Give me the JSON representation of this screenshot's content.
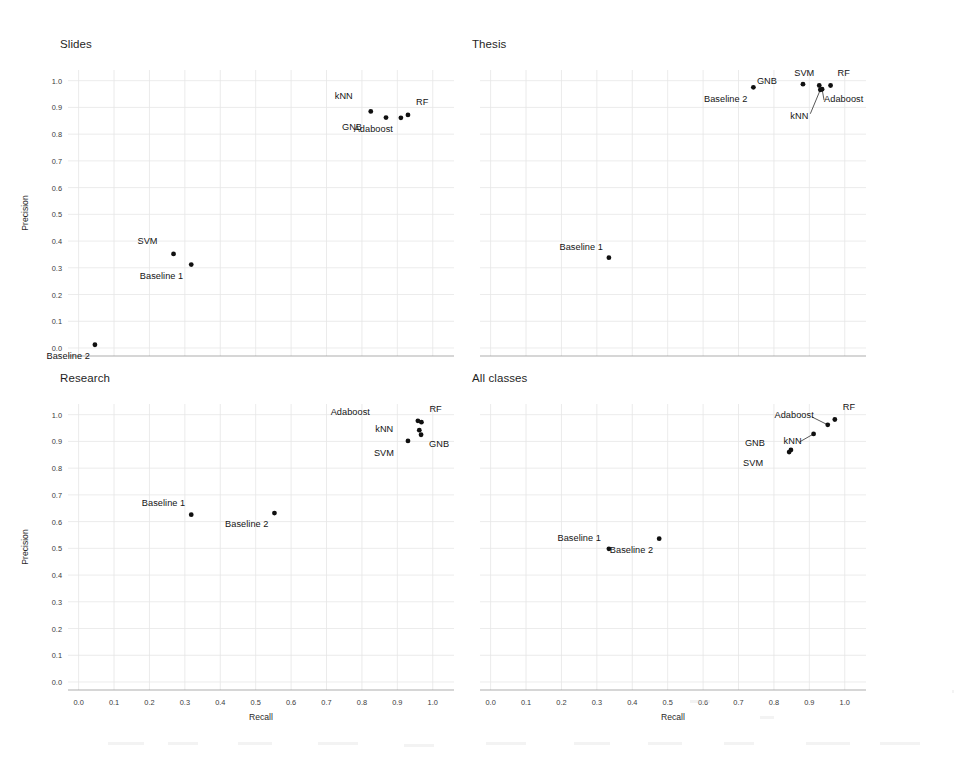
{
  "figure": {
    "width": 954,
    "height": 771,
    "background": "#ffffff",
    "point_color": "#101010",
    "grid_color": "#e6e6e6",
    "axis_color": "#8a8a8a"
  },
  "chart_data": {
    "type": "scatter",
    "title": "",
    "xlabel": "Recall",
    "ylabel": "Precision",
    "xlim": [
      -0.03,
      1.06
    ],
    "ylim": [
      -0.03,
      1.04
    ],
    "grid": true,
    "legend": "none",
    "xticks": [
      "0.0",
      "0.1",
      "0.2",
      "0.3",
      "0.4",
      "0.5",
      "0.6",
      "0.7",
      "0.8",
      "0.9",
      "1.0"
    ],
    "xtick_values": [
      0.0,
      0.1,
      0.2,
      0.3,
      0.4,
      0.5,
      0.6,
      0.7,
      0.8,
      0.9,
      1.0
    ],
    "yticks": [
      "0.0",
      "0.1",
      "0.2",
      "0.3",
      "0.4",
      "0.5",
      "0.6",
      "0.7",
      "0.8",
      "0.9",
      "1.0"
    ],
    "ytick_values": [
      0.0,
      0.1,
      0.2,
      0.3,
      0.4,
      0.5,
      0.6,
      0.7,
      0.8,
      0.9,
      1.0
    ],
    "panels": [
      {
        "id": "slides",
        "title": "Slides",
        "show_ylabel": true,
        "show_yticks": true,
        "show_xticks": false,
        "show_xlabel": false,
        "points": [
          {
            "name": "kNN",
            "x": 0.825,
            "y": 0.885,
            "label_dx": -18,
            "label_dy": -14,
            "leader": false
          },
          {
            "name": "GNB",
            "x": 0.868,
            "y": 0.862,
            "label_dx": -24,
            "label_dy": 10,
            "leader": false
          },
          {
            "name": "Adaboost",
            "x": 0.91,
            "y": 0.861,
            "label_dx": -8,
            "label_dy": 12,
            "leader": false
          },
          {
            "name": "RF",
            "x": 0.93,
            "y": 0.872,
            "label_dx": 8,
            "label_dy": -12,
            "leader": false
          },
          {
            "name": "SVM",
            "x": 0.268,
            "y": 0.352,
            "label_dx": -16,
            "label_dy": -12,
            "leader": false
          },
          {
            "name": "Baseline 1",
            "x": 0.318,
            "y": 0.312,
            "label_dx": -8,
            "label_dy": 12,
            "leader": false
          },
          {
            "name": "Baseline 2",
            "x": 0.046,
            "y": 0.012,
            "label_dx": -5,
            "label_dy": 12,
            "leader": false
          }
        ]
      },
      {
        "id": "thesis",
        "title": "Thesis",
        "show_ylabel": false,
        "show_yticks": false,
        "show_xticks": false,
        "show_xlabel": false,
        "points": [
          {
            "name": "Baseline 2",
            "x": 0.742,
            "y": 0.975,
            "label_dx": -6,
            "label_dy": 13,
            "leader": false
          },
          {
            "name": "GNB",
            "x": 0.882,
            "y": 0.987,
            "label_dx": -26,
            "label_dy": -2,
            "leader": false
          },
          {
            "name": "SVM",
            "x": 0.928,
            "y": 0.982,
            "label_dx": -5,
            "label_dy": -12,
            "leader": false
          },
          {
            "name": "RF",
            "x": 0.96,
            "y": 0.982,
            "label_dx": 7,
            "label_dy": -12,
            "leader": false
          },
          {
            "name": "Adaboost",
            "x": 0.936,
            "y": 0.968,
            "label_dx": 2,
            "label_dy": 11,
            "leader": true,
            "leader_dx": 2,
            "leader_dy": 11
          },
          {
            "name": "kNN",
            "x": 0.931,
            "y": 0.966,
            "label_dx": -12,
            "label_dy": 27,
            "leader": true,
            "leader_dx": -10,
            "leader_dy": 24
          },
          {
            "name": "Baseline 1",
            "x": 0.334,
            "y": 0.338,
            "label_dx": -6,
            "label_dy": -10,
            "leader": false
          }
        ]
      },
      {
        "id": "research",
        "title": "Research",
        "show_ylabel": true,
        "show_yticks": true,
        "show_xticks": true,
        "show_xlabel": true,
        "points": [
          {
            "name": "Adaboost",
            "x": 0.958,
            "y": 0.977,
            "label_dx": -48,
            "label_dy": -8,
            "leader": false
          },
          {
            "name": "RF",
            "x": 0.968,
            "y": 0.972,
            "label_dx": 8,
            "label_dy": -12,
            "leader": false
          },
          {
            "name": "kNN",
            "x": 0.962,
            "y": 0.942,
            "label_dx": -26,
            "label_dy": 0,
            "leader": false
          },
          {
            "name": "GNB",
            "x": 0.967,
            "y": 0.925,
            "label_dx": 8,
            "label_dy": 10,
            "leader": false
          },
          {
            "name": "SVM",
            "x": 0.93,
            "y": 0.902,
            "label_dx": -14,
            "label_dy": 13,
            "leader": false
          },
          {
            "name": "Baseline 1",
            "x": 0.318,
            "y": 0.626,
            "label_dx": -6,
            "label_dy": -11,
            "leader": false
          },
          {
            "name": "Baseline 2",
            "x": 0.553,
            "y": 0.632,
            "label_dx": -6,
            "label_dy": 12,
            "leader": false
          }
        ]
      },
      {
        "id": "all-classes",
        "title": "All classes",
        "show_ylabel": false,
        "show_yticks": false,
        "show_xticks": true,
        "show_xlabel": true,
        "points": [
          {
            "name": "RF",
            "x": 0.972,
            "y": 0.982,
            "label_dx": 8,
            "label_dy": -12,
            "leader": false
          },
          {
            "name": "Adaboost",
            "x": 0.952,
            "y": 0.962,
            "label_dx": -14,
            "label_dy": -9,
            "leader": true,
            "leader_dx": -16,
            "leader_dy": -8
          },
          {
            "name": "kNN",
            "x": 0.912,
            "y": 0.928,
            "label_dx": -12,
            "label_dy": 8,
            "leader": true,
            "leader_dx": -14,
            "leader_dy": 8
          },
          {
            "name": "GNB",
            "x": 0.848,
            "y": 0.868,
            "label_dx": -26,
            "label_dy": -6,
            "leader": false
          },
          {
            "name": "SVM",
            "x": 0.843,
            "y": 0.86,
            "label_dx": -26,
            "label_dy": 12,
            "leader": false
          },
          {
            "name": "Baseline 1",
            "x": 0.334,
            "y": 0.498,
            "label_dx": -8,
            "label_dy": -10,
            "leader": false
          },
          {
            "name": "Baseline 2",
            "x": 0.476,
            "y": 0.536,
            "label_dx": -6,
            "label_dy": 12,
            "leader": false
          }
        ]
      }
    ]
  }
}
